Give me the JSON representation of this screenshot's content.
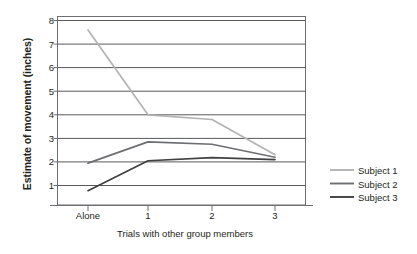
{
  "chart_data": {
    "type": "line",
    "title": "",
    "xlabel": "Trials with other group members",
    "ylabel": "Estimate of movement (inches)",
    "categories": [
      "Alone",
      "1",
      "2",
      "3"
    ],
    "x_tick_labels": [
      "Alone",
      "1",
      "2",
      "3"
    ],
    "y_tick_labels": [
      "8",
      "7",
      "6",
      "5",
      "4",
      "3",
      "2",
      "1"
    ],
    "ylim": [
      0,
      8
    ],
    "yticks": [
      1,
      2,
      3,
      4,
      5,
      6,
      7,
      8
    ],
    "grid": "horizontal",
    "legend_position": "right",
    "series": [
      {
        "name": "Subject 1",
        "color": "#b3b3b3",
        "values": [
          7.6,
          4.0,
          3.8,
          2.3
        ]
      },
      {
        "name": "Subject 2",
        "color": "#6d6e71",
        "values": [
          1.95,
          2.85,
          2.75,
          2.2
        ]
      },
      {
        "name": "Subject 3",
        "color": "#414042",
        "values": [
          0.78,
          2.05,
          2.18,
          2.1
        ]
      }
    ]
  },
  "legend": {
    "items": [
      {
        "label": "Subject 1"
      },
      {
        "label": "Subject 2"
      },
      {
        "label": "Subject 3"
      }
    ]
  },
  "axes": {
    "y_label": "Estimate of movement (inches)",
    "x_label": "Trials with other group members"
  }
}
